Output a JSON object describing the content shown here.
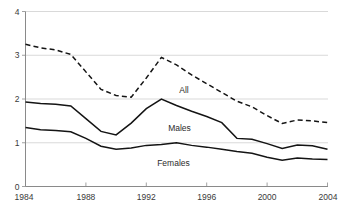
{
  "chart_data": {
    "type": "line",
    "title": "",
    "subtitle": "",
    "xlabel": "",
    "ylabel": "",
    "xlim": [
      1984,
      2004
    ],
    "ylim": [
      0,
      4
    ],
    "x_ticks": [
      1984,
      1988,
      1992,
      1996,
      2000,
      2004
    ],
    "x_tick_labels": [
      "1984",
      "1988",
      "1992",
      "1996",
      "2000",
      "2004"
    ],
    "y_ticks": [
      0,
      1,
      2,
      3,
      4
    ],
    "y_tick_labels": [
      "0",
      "1",
      "2",
      "3",
      "4"
    ],
    "grid": "horizontal",
    "legend": "inline-annotations",
    "x": [
      1984,
      1985,
      1986,
      1987,
      1988,
      1989,
      1990,
      1991,
      1992,
      1993,
      1994,
      1995,
      1996,
      1997,
      1998,
      1999,
      2000,
      2001,
      2002,
      2003,
      2004
    ],
    "series": [
      {
        "name": "All",
        "style": "dashed",
        "color": "#141414",
        "label": "All",
        "label_x": 1994.5,
        "label_y": 2.21,
        "values": [
          3.25,
          3.17,
          3.12,
          3.02,
          2.62,
          2.22,
          2.08,
          2.04,
          2.48,
          2.95,
          2.78,
          2.55,
          2.35,
          2.15,
          1.95,
          1.82,
          1.62,
          1.44,
          1.52,
          1.5,
          1.46
        ]
      },
      {
        "name": "Males",
        "style": "solid",
        "color": "#141414",
        "label": "Males",
        "label_x": 1994.2,
        "label_y": 1.34,
        "values": [
          1.93,
          1.9,
          1.88,
          1.84,
          1.55,
          1.26,
          1.18,
          1.45,
          1.78,
          2.0,
          1.85,
          1.72,
          1.6,
          1.46,
          1.1,
          1.08,
          0.98,
          0.87,
          0.95,
          0.93,
          0.85
        ]
      },
      {
        "name": "Females",
        "style": "solid",
        "color": "#141414",
        "label": "Females",
        "label_x": 1993.8,
        "label_y": 0.53,
        "values": [
          1.35,
          1.3,
          1.28,
          1.25,
          1.1,
          0.92,
          0.85,
          0.88,
          0.94,
          0.96,
          1.0,
          0.94,
          0.9,
          0.85,
          0.8,
          0.76,
          0.67,
          0.6,
          0.65,
          0.63,
          0.62
        ]
      }
    ]
  },
  "axes": {
    "x_axis_name": "year-axis",
    "y_axis_name": "value-axis"
  }
}
